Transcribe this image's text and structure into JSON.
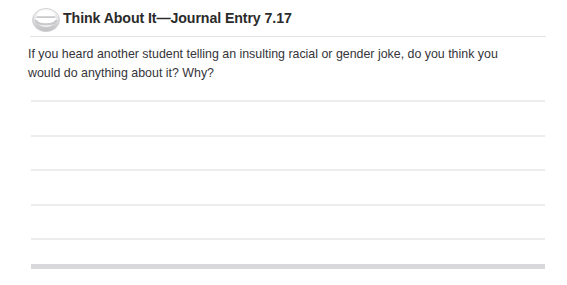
{
  "header": {
    "icon": "journal-circle-icon",
    "title": "Think About It—Journal Entry 7.17"
  },
  "prompt": {
    "line1": "If you heard another student telling an insulting racial or gender joke, do you think you",
    "line2": "would do anything about it? Why?",
    "full_text": "If you heard another student telling an insulting racial or gender joke, do you think you would do anything about it? Why?"
  },
  "answer_area": {
    "line_count": 5,
    "line_tops": [
      100,
      135,
      169,
      204,
      238
    ]
  },
  "colors": {
    "title_text": "#2b2b2b",
    "body_text": "#35353a",
    "rule_line": "#ededee",
    "header_rule": "#e3e3e3",
    "bottom_bar": "#d9d9db",
    "icon_grey": "#c9c9cb",
    "page_background": "#ffffff"
  }
}
